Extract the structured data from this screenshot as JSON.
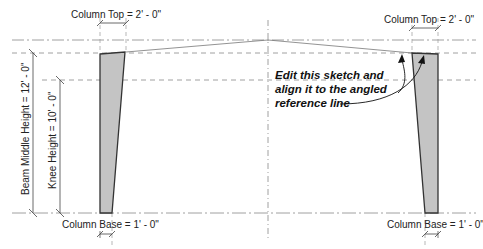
{
  "diagram": {
    "type": "revit-family-sketch",
    "colors": {
      "column_fill": "#c4c4c4",
      "column_stroke": "#333333",
      "reference_line": "#777777",
      "dimension_line": "#444444",
      "text": "#222222"
    },
    "dimensions": {
      "column_top_left": "Column Top = 2' - 0\"",
      "column_top_right": "Column Top = 2' - 0\"",
      "column_base_left": "Column Base = 1' - 0\"",
      "column_base_right": "Column Base = 1' - 0\"",
      "beam_middle_height": "Beam Middle Height = 12' - 0\"",
      "knee_height": "Knee Height = 10' - 0\""
    },
    "annotation": {
      "line1": "Edit this sketch and",
      "line2": "align it to the angled",
      "line3": "reference line"
    }
  }
}
